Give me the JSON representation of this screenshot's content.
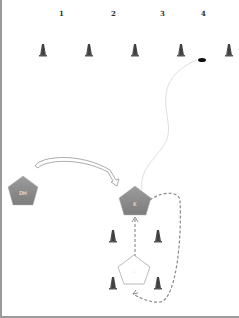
{
  "diagram": {
    "column_labels": [
      {
        "label": "1",
        "x": 61,
        "y": 13
      },
      {
        "label": "2",
        "x": 113,
        "y": 13
      },
      {
        "label": "3",
        "x": 162,
        "y": 13
      },
      {
        "label": "4",
        "x": 203,
        "y": 13
      }
    ],
    "top_cones": [
      {
        "x": 43,
        "y": 50
      },
      {
        "x": 89,
        "y": 50
      },
      {
        "x": 135,
        "y": 50
      },
      {
        "x": 181,
        "y": 50
      },
      {
        "x": 229,
        "y": 50
      }
    ],
    "ball": {
      "x": 202,
      "y": 60
    },
    "players": [
      {
        "id": "player-left",
        "label": "DH",
        "x": 23,
        "y": 192,
        "fill": "#8c8c8c"
      },
      {
        "id": "player-center",
        "label": "K",
        "x": 135,
        "y": 203,
        "fill": "#8c8c8c"
      },
      {
        "id": "player-bottom",
        "label": "",
        "x": 134,
        "y": 272,
        "fill": "#ffffff"
      }
    ],
    "box_cones": [
      {
        "x": 113,
        "y": 236
      },
      {
        "x": 158,
        "y": 236
      },
      {
        "x": 113,
        "y": 283
      },
      {
        "x": 158,
        "y": 283
      }
    ],
    "colors": {
      "cone": "#4a4a4a",
      "player": "#8c8c8c",
      "dashed_run": "#888888",
      "ball_path": "#d8d8d8",
      "border": "#9a9a9a"
    }
  }
}
